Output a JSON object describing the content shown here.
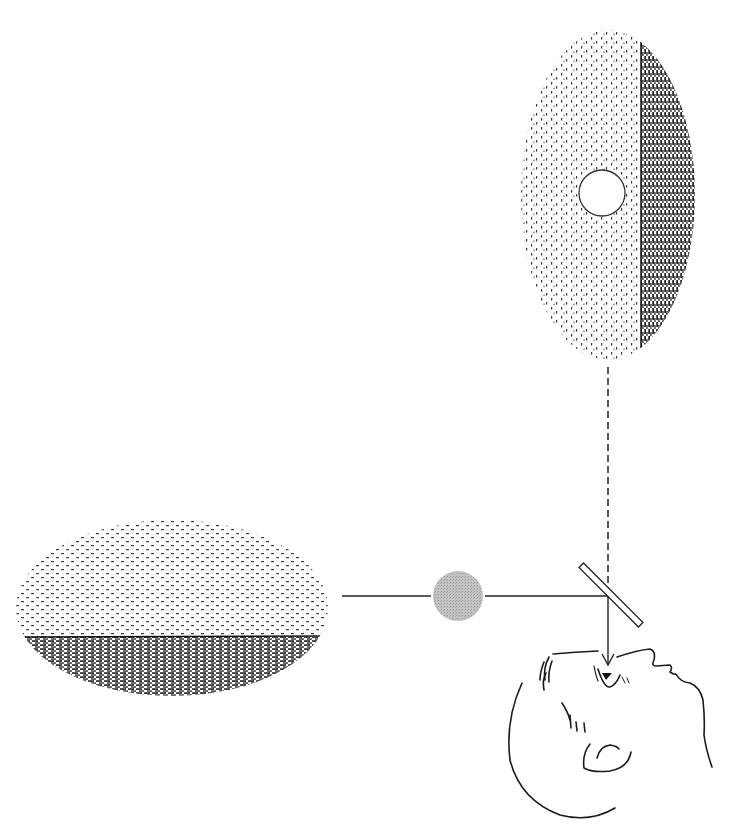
{
  "figure": {
    "description": "Line illustration of an optical viewing arrangement: an observer looks upward through a tilted beam-splitter plate that combines a view of a horizontally split field (light above, dark below) seen through a gray disk, with a vertically split field (light left, dark right) containing a white circular aperture.",
    "colors": {
      "background": "#ffffff",
      "ink": "#1a1a1a",
      "light_field_dots": "#3a3a3a",
      "dark_field_hatching": "#111111",
      "gray_disk": "#b8b8b8",
      "aperture": "#ffffff"
    },
    "elements": {
      "upper_field": {
        "shape": "vertical oval",
        "left_half": "light stippled",
        "right_half": "dark hatched",
        "aperture": "white circle in light half"
      },
      "lower_field": {
        "shape": "horizontal oval",
        "top_half": "light stippled",
        "bottom_half": "dark hatched"
      },
      "vertical_path": "dashed line from upper field down to beam splitter",
      "horizontal_path": "solid line from lower field through gray disk to beam splitter",
      "gray_disk": "solid gray filter disk on horizontal path",
      "beam_splitter": "tilted thin plate at 45 degrees",
      "eye_ray": "solid arrow from beam splitter down into observer's eye",
      "observer": "line drawing of a head tilted back, looking up"
    }
  }
}
